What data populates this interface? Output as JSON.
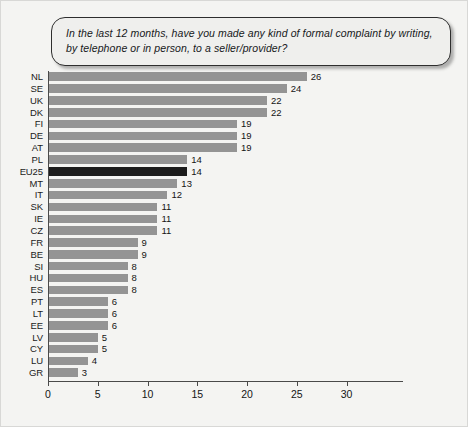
{
  "question": {
    "text": "In the last 12 months, have you made any kind of formal complaint by writing, by telephone or in person, to a seller/provider?"
  },
  "chart_data": {
    "type": "bar",
    "orientation": "horizontal",
    "title": "",
    "subtitle": "",
    "xlabel": "",
    "ylabel": "",
    "xlim": [
      0,
      30
    ],
    "xticks": [
      0,
      5,
      10,
      15,
      20,
      25,
      30
    ],
    "grid": false,
    "legend": null,
    "bar_color": "#949494",
    "highlight_color": "#1c1c1c",
    "highlight_category": "EU25",
    "categories": [
      "NL",
      "SE",
      "UK",
      "DK",
      "FI",
      "DE",
      "AT",
      "PL",
      "EU25",
      "MT",
      "IT",
      "SK",
      "IE",
      "CZ",
      "FR",
      "BE",
      "SI",
      "HU",
      "ES",
      "PT",
      "LT",
      "EE",
      "LV",
      "CY",
      "LU",
      "GR"
    ],
    "values": [
      26,
      24,
      22,
      22,
      19,
      19,
      19,
      14,
      14,
      13,
      12,
      11,
      11,
      11,
      9,
      9,
      8,
      8,
      8,
      6,
      6,
      6,
      5,
      5,
      4,
      3
    ]
  }
}
